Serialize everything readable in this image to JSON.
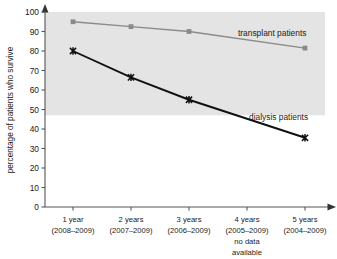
{
  "chart_data": {
    "type": "line",
    "title": "",
    "xlabel": "",
    "ylabel": "percentage of patients who survive",
    "ylim": [
      0,
      100
    ],
    "ytick_step": 10,
    "grid": false,
    "legend_position": "inline-annotation",
    "categories": [
      "1 year\n(2008–2009)",
      "2 years\n(2007–2009)",
      "3 years\n(2006–2009)",
      "4 years\n(2005–2009)\nno data\navailable",
      "5 years\n(2004–2009)"
    ],
    "x": [
      "1 year",
      "2 years",
      "3 years",
      "4 years",
      "5 years"
    ],
    "series": [
      {
        "name": "transplant patients",
        "color": "#8a8a8a",
        "marker": "square",
        "values": [
          95,
          92.5,
          90,
          null,
          81.5
        ]
      },
      {
        "name": "dialysis patients",
        "color": "#111111",
        "marker": "x",
        "values": [
          80,
          66.5,
          55,
          null,
          35.5
        ]
      }
    ],
    "annotations": [
      {
        "text": "transplant patients",
        "series": "transplant patients"
      },
      {
        "text": "dialysis patients",
        "series": "dialysis patients"
      },
      {
        "text": "no data available",
        "category": "4 years"
      }
    ],
    "shaded_band": {
      "from": 47,
      "to": 100,
      "color": "#e4e4e4"
    }
  },
  "axes": {
    "y": {
      "label": "percentage of patients who survive",
      "ticks": [
        "0",
        "10",
        "20",
        "30",
        "40",
        "50",
        "60",
        "70",
        "80",
        "90",
        "100"
      ]
    },
    "x": {
      "ticks": [
        {
          "line1": "1 year",
          "line2": "(2008–2009)",
          "line3": "",
          "line4": ""
        },
        {
          "line1": "2 years",
          "line2": "(2007–2009)",
          "line3": "",
          "line4": ""
        },
        {
          "line1": "3 years",
          "line2": "(2006–2009)",
          "line3": "",
          "line4": ""
        },
        {
          "line1": "4 years",
          "line2": "(2005–2009)",
          "line3": "no data",
          "line4": "available"
        },
        {
          "line1": "5 years",
          "line2": "(2004–2009)",
          "line3": "",
          "line4": ""
        }
      ]
    }
  },
  "series_labels": {
    "transplant": "transplant patients",
    "dialysis": "dialysis patients"
  },
  "colors": {
    "transplant_line": "#8a8a8a",
    "dialysis_line": "#111111",
    "band": "#e4e4e4",
    "axis": "#555555",
    "text": "#1a1a1a",
    "background": "#ffffff"
  }
}
